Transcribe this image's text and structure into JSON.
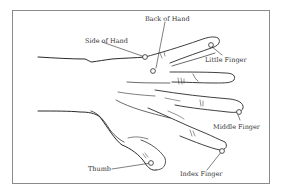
{
  "diagram": {
    "colors": {
      "line": "#2a2a2a",
      "frame": "#8a8a8a",
      "text": "#333333",
      "background": "#ffffff"
    },
    "labels": [
      {
        "id": "side-of-hand",
        "text": "Side of Hand"
      },
      {
        "id": "back-of-hand",
        "text": "Back of Hand"
      },
      {
        "id": "little-finger",
        "text": "Little Finger"
      },
      {
        "id": "middle-finger",
        "text": "Middle Finger"
      },
      {
        "id": "index-finger",
        "text": "Index Finger"
      },
      {
        "id": "thumb",
        "text": "Thumb"
      }
    ]
  }
}
